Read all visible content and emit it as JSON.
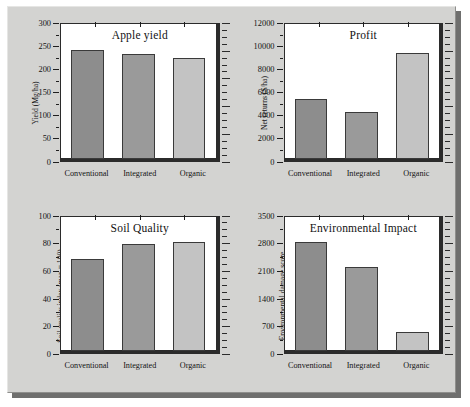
{
  "figure": {
    "background_color": "#d3d3d1",
    "panel_background": "#ffffff",
    "axis_color": "#2b2b2b",
    "bar_colors": {
      "conventional": "#8d8d8d",
      "integrated": "#9a9a9a",
      "organic": "#c3c3c3"
    }
  },
  "chart_data": [
    {
      "type": "bar",
      "title": "Apple yield",
      "xlabel": "",
      "ylabel": "Yield (Mg/ha)",
      "categories": [
        "Conventional",
        "Integrated",
        "Organic"
      ],
      "values": [
        244,
        234,
        225
      ],
      "ylim": [
        0,
        300
      ],
      "yticks": [
        0,
        50,
        100,
        150,
        200,
        250,
        300
      ],
      "ytick_labels": [
        "0",
        "50",
        "100",
        "150",
        "200",
        "250",
        "300"
      ],
      "grid": false,
      "legend": "none"
    },
    {
      "type": "bar",
      "title": "Profit",
      "xlabel": "",
      "ylabel": "Net returns ($/ha)",
      "categories": [
        "Conventional",
        "Integrated",
        "Organic"
      ],
      "values": [
        5350,
        4200,
        9500
      ],
      "ylim": [
        0,
        12000
      ],
      "yticks": [
        0,
        2000,
        4000,
        6000,
        8000,
        10000,
        12000
      ],
      "ytick_labels": [
        "0",
        "2000",
        "4000",
        "6000",
        "8000",
        "10000",
        "12000"
      ],
      "grid": false,
      "legend": "none"
    },
    {
      "type": "bar",
      "title": "Soil Quality",
      "xlabel": "",
      "ylabel": "Soil quality index (max = 100)",
      "categories": [
        "Conventional",
        "Integrated",
        "Organic"
      ],
      "values": [
        69,
        80,
        82
      ],
      "ylim": [
        0,
        100
      ],
      "yticks": [
        0,
        20,
        40,
        60,
        80,
        100
      ],
      "ytick_labels": [
        "0",
        "20",
        "40",
        "60",
        "80",
        "100"
      ],
      "grid": false,
      "legend": "none"
    },
    {
      "type": "bar",
      "title": "Environmental Impact",
      "xlabel": "",
      "ylabel": "Environmental damage score",
      "categories": [
        "Conventional",
        "Integrated",
        "Organic"
      ],
      "values": [
        2850,
        2200,
        500
      ],
      "ylim": [
        0,
        3500
      ],
      "yticks": [
        0,
        700,
        1400,
        2100,
        2800,
        3500
      ],
      "ytick_labels": [
        "0",
        "700",
        "1400",
        "2100",
        "2800",
        "3500"
      ],
      "grid": false,
      "legend": "none"
    }
  ]
}
